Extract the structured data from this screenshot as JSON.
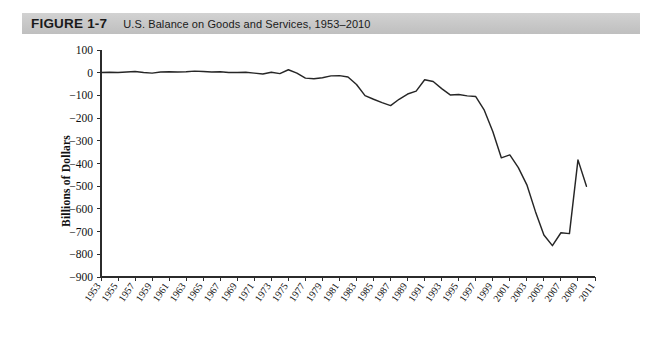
{
  "header": {
    "figure_label": "FIGURE 1-7",
    "title": "U.S. Balance on Goods and Services, 1953–2010",
    "bar_color": "#c9c9c9"
  },
  "axes": {
    "y_title": "Billions of Dollars",
    "y_ticks": [
      "100",
      "0",
      "−100",
      "−200",
      "−300",
      "−400",
      "−500",
      "−600",
      "−700",
      "−800",
      "−900"
    ],
    "x_ticks": [
      "1953",
      "1955",
      "1957",
      "1959",
      "1961",
      "1963",
      "1965",
      "1967",
      "1969",
      "1971",
      "1973",
      "1975",
      "1977",
      "1979",
      "1981",
      "1983",
      "1985",
      "1987",
      "1989",
      "1991",
      "1993",
      "1995",
      "1997",
      "1999",
      "2001",
      "2003",
      "2005",
      "2007",
      "2009",
      "2011"
    ]
  },
  "chart_data": {
    "type": "line",
    "title": "U.S. Balance on Goods and Services, 1953–2010",
    "xlabel": "",
    "ylabel": "Billions of Dollars",
    "xlim": [
      1953,
      2011
    ],
    "ylim": [
      -900,
      100
    ],
    "grid": false,
    "legend": "none",
    "line_color": "#262626",
    "x": [
      1953,
      1954,
      1955,
      1956,
      1957,
      1958,
      1959,
      1960,
      1961,
      1962,
      1963,
      1964,
      1965,
      1966,
      1967,
      1968,
      1969,
      1970,
      1971,
      1972,
      1973,
      1974,
      1975,
      1976,
      1977,
      1978,
      1979,
      1980,
      1981,
      1982,
      1983,
      1984,
      1985,
      1986,
      1987,
      1988,
      1989,
      1990,
      1991,
      1992,
      1993,
      1994,
      1995,
      1996,
      1997,
      1998,
      1999,
      2000,
      2001,
      2002,
      2003,
      2004,
      2005,
      2006,
      2007,
      2008,
      2009,
      2010
    ],
    "values": [
      1,
      2,
      1,
      3,
      5,
      1,
      -2,
      3,
      4,
      3,
      4,
      7,
      5,
      3,
      4,
      1,
      1,
      2,
      -2,
      -6,
      2,
      -4,
      13,
      -2,
      -24,
      -27,
      -22,
      -14,
      -13,
      -19,
      -52,
      -101,
      -117,
      -132,
      -145,
      -117,
      -94,
      -81,
      -31,
      -39,
      -70,
      -98,
      -96,
      -102,
      -105,
      -165,
      -259,
      -375,
      -362,
      -418,
      -494,
      -611,
      -715,
      -762,
      -705,
      -709,
      -384,
      -500
    ],
    "annotations": []
  }
}
